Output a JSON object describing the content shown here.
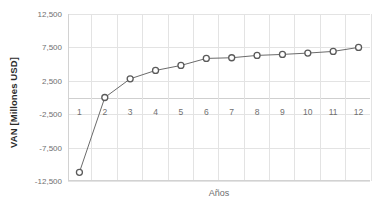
{
  "chart_data": {
    "type": "line",
    "title": "",
    "xlabel": "Años",
    "ylabel": "VAN [Millones USD]",
    "categories": [
      1,
      2,
      3,
      4,
      5,
      6,
      7,
      8,
      9,
      10,
      11,
      12
    ],
    "x_tick_labels": [
      "1",
      "2",
      "3",
      "4",
      "5",
      "6",
      "7",
      "8",
      "9",
      "10",
      "11",
      "12"
    ],
    "y_tick_labels": [
      "12,500",
      "7,500",
      "2,500",
      "-2,500",
      "-7,500",
      "-12,500"
    ],
    "y_ticks": [
      12500,
      7500,
      2500,
      -2500,
      -7500,
      -12500
    ],
    "ylim": [
      -12500,
      12500
    ],
    "xlim": [
      0.55,
      12.45
    ],
    "grid": true,
    "legend": false,
    "series": [
      {
        "name": "VAN",
        "values": [
          -11200,
          0,
          2800,
          4050,
          4800,
          5850,
          5950,
          6300,
          6450,
          6650,
          6900,
          7500
        ]
      }
    ],
    "marker": "circle-open",
    "colors": {
      "line": "#6b6b6b",
      "marker_stroke": "#5a5a5a",
      "marker_fill": "#ffffff",
      "grid": "#e3e3e3",
      "axis": "#d2d2d2",
      "tick_text": "#6f6f6f",
      "axis_title": "#2b2b2b",
      "background": "#ffffff"
    }
  }
}
